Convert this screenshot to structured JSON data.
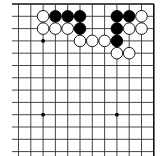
{
  "board": {
    "description": "Go problem diagram, top-right corner",
    "origin_x": 18.5,
    "origin_y": 4,
    "spacing": 12.3,
    "cols": 12,
    "rows": 13,
    "left_extend": 12,
    "bottom_extend": 156,
    "right_edge_col": 11,
    "top_edge_row": 0,
    "line_color": "#333333",
    "edge_color": "#111111",
    "star_points": [
      [
        2,
        3
      ],
      [
        2,
        9
      ],
      [
        8,
        9
      ]
    ],
    "stones": [
      {
        "color": "white",
        "col": 2,
        "row": 1
      },
      {
        "color": "black",
        "col": 3,
        "row": 1
      },
      {
        "color": "black",
        "col": 4,
        "row": 1
      },
      {
        "color": "black",
        "col": 5,
        "row": 1
      },
      {
        "color": "black",
        "col": 8,
        "row": 1
      },
      {
        "color": "black",
        "col": 9,
        "row": 1
      },
      {
        "color": "white",
        "col": 10,
        "row": 1
      },
      {
        "color": "white",
        "col": 2,
        "row": 2
      },
      {
        "color": "white",
        "col": 3,
        "row": 2
      },
      {
        "color": "white",
        "col": 4,
        "row": 2
      },
      {
        "color": "black",
        "col": 5,
        "row": 2
      },
      {
        "color": "black",
        "col": 8,
        "row": 2
      },
      {
        "color": "white",
        "col": 9,
        "row": 2
      },
      {
        "color": "white",
        "col": 10,
        "row": 2
      },
      {
        "color": "white",
        "col": 5,
        "row": 3
      },
      {
        "color": "white",
        "col": 6,
        "row": 3
      },
      {
        "color": "white",
        "col": 7,
        "row": 3
      },
      {
        "color": "black",
        "col": 8,
        "row": 3
      },
      {
        "color": "white",
        "col": 8,
        "row": 4
      },
      {
        "color": "white",
        "col": 9,
        "row": 4
      }
    ]
  }
}
